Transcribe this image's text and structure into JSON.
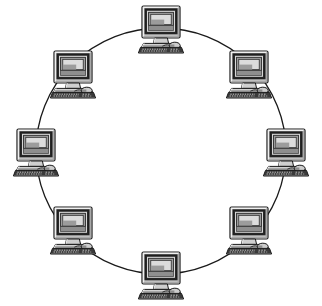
{
  "diagram": {
    "title": "Ring network topology",
    "type": "network-topology-ring",
    "background_color": "#ffffff",
    "canvas": {
      "width": 322,
      "height": 306
    },
    "ring": {
      "label": "ring-connection-line",
      "shape": "circle",
      "center_x": 161,
      "center_y": 151,
      "radius_x": 125,
      "radius_y": 123,
      "stroke_color": "#1a1a1a",
      "stroke_width": 1.3,
      "fill": "none"
    },
    "device_count": 8,
    "device_type": "desktop-computer",
    "device_colors": {
      "outline": "#1a1a1a",
      "case_light": "#e8e8e8",
      "case_mid": "#bdbdbd",
      "case_dark": "#8a8a8a",
      "bezel": "#4a4a4a",
      "screen": "#9a9a9a",
      "screen_highlight": "#d8d8d8",
      "keyboard": "#3a3a3a",
      "shadow": "#707070"
    },
    "devices": [
      {
        "id": "node-1",
        "label": "Computer 1",
        "position": "top",
        "angle_deg": 270,
        "x": 161,
        "y": 28,
        "scale": 1.0
      },
      {
        "id": "node-2",
        "label": "Computer 2",
        "position": "top-right",
        "angle_deg": 315,
        "x": 249,
        "y": 73,
        "scale": 1.0
      },
      {
        "id": "node-3",
        "label": "Computer 3",
        "position": "right",
        "angle_deg": 0,
        "x": 286,
        "y": 151,
        "scale": 1.0
      },
      {
        "id": "node-4",
        "label": "Computer 4",
        "position": "bottom-right",
        "angle_deg": 45,
        "x": 249,
        "y": 229,
        "scale": 1.0
      },
      {
        "id": "node-5",
        "label": "Computer 5",
        "position": "bottom",
        "angle_deg": 90,
        "x": 161,
        "y": 274,
        "scale": 1.0
      },
      {
        "id": "node-6",
        "label": "Computer 6",
        "position": "bottom-left",
        "angle_deg": 135,
        "x": 73,
        "y": 229,
        "scale": 1.0
      },
      {
        "id": "node-7",
        "label": "Computer 7",
        "position": "left",
        "angle_deg": 180,
        "x": 36,
        "y": 151,
        "scale": 1.0
      },
      {
        "id": "node-8",
        "label": "Computer 8",
        "position": "top-left",
        "angle_deg": 225,
        "x": 73,
        "y": 73,
        "scale": 1.0
      }
    ]
  }
}
